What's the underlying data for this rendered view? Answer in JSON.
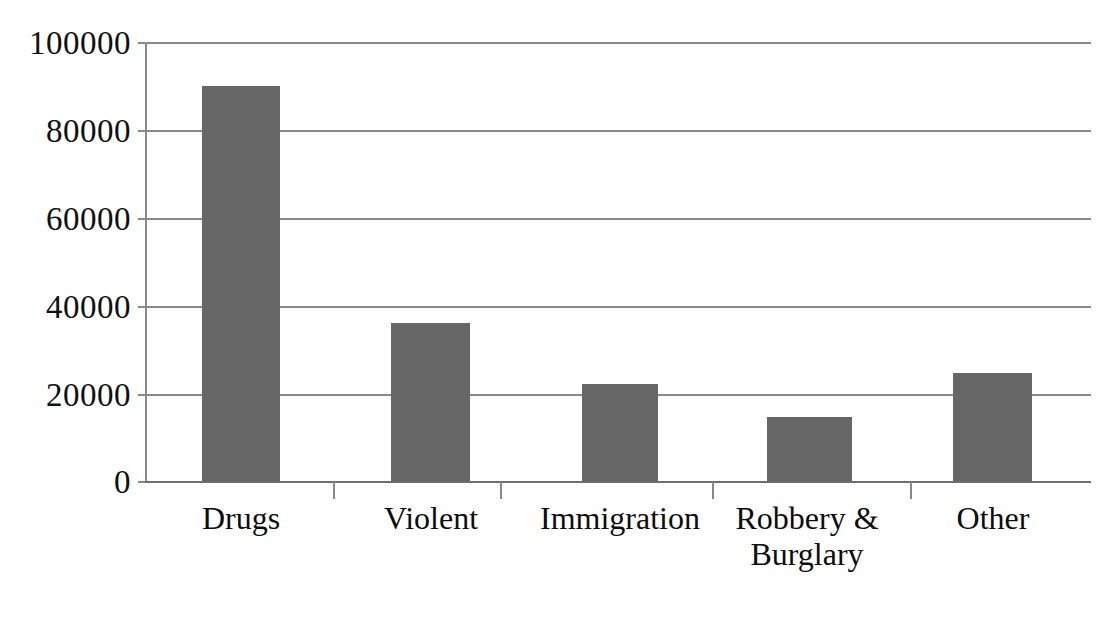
{
  "chart_data": {
    "type": "bar",
    "title": "",
    "subtitle": "",
    "xlabel": "",
    "ylabel": "",
    "categories": [
      "Drugs",
      "Violent",
      "Immigration",
      "Robbery &\nBurglary",
      "Other"
    ],
    "values": [
      90000,
      36000,
      22000,
      14500,
      24500
    ],
    "ylim": [
      0,
      100000
    ],
    "ytick_labels": [
      "100000",
      "80000",
      "60000",
      "40000",
      "20000",
      "0"
    ],
    "ytick_values": [
      100000,
      80000,
      60000,
      40000,
      20000,
      0
    ],
    "grid": true,
    "legend": false,
    "legend_position": "none",
    "bar_color": "#676767",
    "gridline_color": "#8a8a8a",
    "axis_color": "#8a8a8a",
    "background_color": "#ffffff",
    "text_color": "#0d0d0d"
  }
}
